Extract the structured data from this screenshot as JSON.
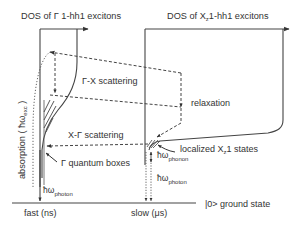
{
  "diagram": {
    "title_left": "DOS of Γ 1-hh1 excitons",
    "title_right_prefix": "DOS of X",
    "title_right_sub": "z",
    "title_right_suffix": "1-hh1 excitons",
    "y_axis_label_prefix": "absorption ( ħω",
    "y_axis_label_sub": "exc",
    "y_axis_label_suffix": " )",
    "labels": {
      "gamma_x": "Γ-X scattering",
      "relaxation": "relaxation",
      "x_gamma": "X-Γ scattering",
      "quantum_boxes": "Γ quantum boxes",
      "localized_prefix": "localized X",
      "localized_sub": "z",
      "localized_suffix": "1 states",
      "hw_phonon_main": "ħω",
      "hw_phonon_sub": "phonon",
      "hw_photon_main": "ħω",
      "hw_photon_sub": "photon",
      "fast": "fast (ns)",
      "slow": "slow (μs)",
      "ground_state": "|0> ground state"
    },
    "colors": {
      "line": "#333333",
      "text": "#333333",
      "background": "#ffffff"
    }
  }
}
